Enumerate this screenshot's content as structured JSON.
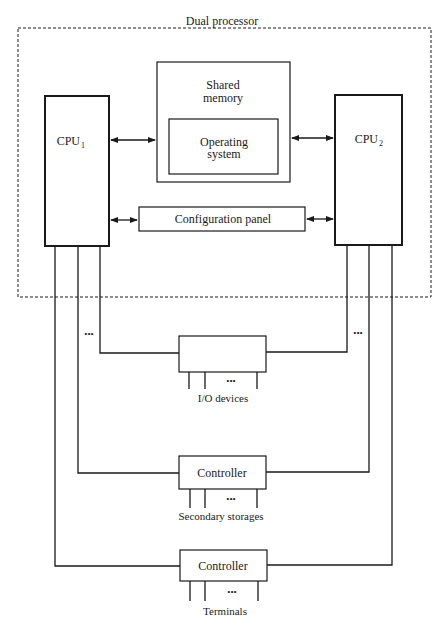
{
  "diagram": {
    "title": "Dual processor",
    "nodes": {
      "cpu1": {
        "label": "CPU",
        "subscript": "1"
      },
      "cpu2": {
        "label": "CPU",
        "subscript": "2"
      },
      "shared_memory": {
        "label_line1": "Shared",
        "label_line2": "memory"
      },
      "operating_system": {
        "label_line1": "Operating",
        "label_line2": "system"
      },
      "configuration_panel": {
        "label": "Configuration panel"
      },
      "io_box": {
        "label": ""
      },
      "storage_controller": {
        "label": "Controller"
      },
      "terminal_controller": {
        "label": "Controller"
      }
    },
    "captions": {
      "io_devices": "I/O devices",
      "secondary_storages": "Secondary storages",
      "terminals": "Terminals"
    },
    "ellipsis": "•••",
    "edges": [
      {
        "from": "cpu1",
        "to": "shared_memory",
        "type": "bidirectional"
      },
      {
        "from": "shared_memory",
        "to": "cpu2",
        "type": "bidirectional"
      },
      {
        "from": "cpu1",
        "to": "configuration_panel",
        "type": "bidirectional"
      },
      {
        "from": "configuration_panel",
        "to": "cpu2",
        "type": "bidirectional"
      },
      {
        "from": "cpu1",
        "to": "io_box",
        "type": "line"
      },
      {
        "from": "cpu2",
        "to": "io_box",
        "type": "line"
      },
      {
        "from": "cpu1",
        "to": "storage_controller",
        "type": "line"
      },
      {
        "from": "cpu2",
        "to": "storage_controller",
        "type": "line"
      },
      {
        "from": "cpu1",
        "to": "terminal_controller",
        "type": "line"
      },
      {
        "from": "cpu2",
        "to": "terminal_controller",
        "type": "line"
      }
    ],
    "colors": {
      "stroke": "#1a1a1a",
      "background": "#ffffff"
    }
  }
}
